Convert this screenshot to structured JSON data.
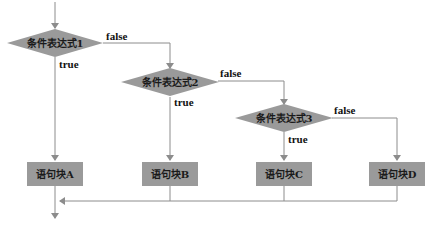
{
  "diagram": {
    "type": "flowchart",
    "colors": {
      "node_fill": "#9a9a9a",
      "line": "#8c8c8c",
      "text": "#1a1a1a",
      "background": "#ffffff"
    },
    "decisions": [
      {
        "id": "cond1",
        "label": "条件表达式1",
        "true_label": "true",
        "false_label": "false"
      },
      {
        "id": "cond2",
        "label": "条件表达式2",
        "true_label": "true",
        "false_label": "false"
      },
      {
        "id": "cond3",
        "label": "条件表达式3",
        "true_label": "true",
        "false_label": "false"
      }
    ],
    "blocks": [
      {
        "id": "blockA",
        "label": "语句块A"
      },
      {
        "id": "blockB",
        "label": "语句块B"
      },
      {
        "id": "blockC",
        "label": "语句块C"
      },
      {
        "id": "blockD",
        "label": "语句块D"
      }
    ],
    "edges": [
      {
        "from": "entry",
        "to": "cond1"
      },
      {
        "from": "cond1",
        "to": "blockA",
        "label": "true"
      },
      {
        "from": "cond1",
        "to": "cond2",
        "label": "false"
      },
      {
        "from": "cond2",
        "to": "blockB",
        "label": "true"
      },
      {
        "from": "cond2",
        "to": "cond3",
        "label": "false"
      },
      {
        "from": "cond3",
        "to": "blockC",
        "label": "true"
      },
      {
        "from": "cond3",
        "to": "blockD",
        "label": "false"
      },
      {
        "from": "blockB",
        "to": "merge"
      },
      {
        "from": "blockC",
        "to": "merge"
      },
      {
        "from": "blockD",
        "to": "merge"
      },
      {
        "from": "blockA",
        "to": "exit"
      }
    ]
  }
}
